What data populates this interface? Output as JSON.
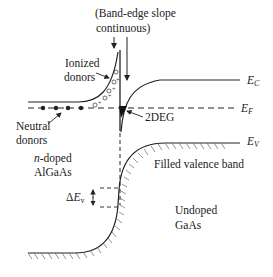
{
  "title": {
    "line1": "(Band-edge slope",
    "line2": "continuous)"
  },
  "labels": {
    "ionized_donors_line1": "Ionized",
    "ionized_donors_line2": "donors",
    "neutral_donors_line1": "Neutral",
    "neutral_donors_line2": "donors",
    "two_deg": "2DEG",
    "n_doped_line1_italic": "n",
    "n_doped_line1_rest": "-doped",
    "n_doped_line2": "AlGaAs",
    "filled_valence_band": "Filled valence band",
    "undoped_line1": "Undoped",
    "undoped_line2": "GaAs",
    "delta_ev_prefix": "Δ",
    "delta_ev_main": "E",
    "delta_ev_sub": "v"
  },
  "band_labels": {
    "ec_main": "E",
    "ec_sub": "C",
    "ef_main": "E",
    "ef_sub": "F",
    "ev_main": "E",
    "ev_sub": "V"
  },
  "ionized_donor_symbol": "O+",
  "colors": {
    "line": "#222222",
    "background": "#ffffff",
    "hatch": "#555555"
  }
}
